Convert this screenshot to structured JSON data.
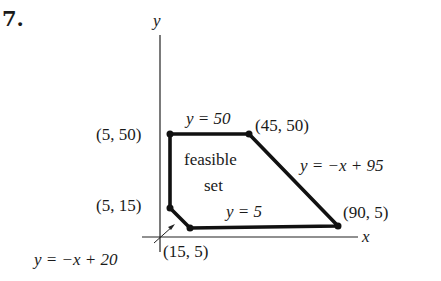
{
  "problem_number": "7.",
  "axes": {
    "x_label": "x",
    "y_label": "y"
  },
  "vertices": [
    {
      "label": "(5, 50)",
      "x": 5,
      "y": 50
    },
    {
      "label": "(45, 50)",
      "x": 45,
      "y": 50
    },
    {
      "label": "(90, 5)",
      "x": 90,
      "y": 5
    },
    {
      "label": "(15, 5)",
      "x": 15,
      "y": 5
    },
    {
      "label": "(5, 15)",
      "x": 5,
      "y": 15
    }
  ],
  "lines": {
    "top": "y = 50",
    "right": "y = −x + 95",
    "bottom": "y = 5",
    "corner": "y = −x + 20"
  },
  "region": {
    "line1": "feasible",
    "line2": "set"
  },
  "colors": {
    "stroke": "#111111",
    "background": "#ffffff"
  }
}
